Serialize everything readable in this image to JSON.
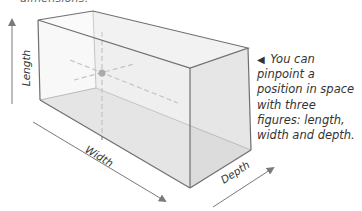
{
  "top_caption": "dimensions.",
  "caption": {
    "marker": "◀",
    "text": "You can pinpoint a position in space with three figures: length, width and depth."
  },
  "axes": {
    "length": "Length",
    "width": "Width",
    "depth": "Depth"
  },
  "colors": {
    "edge": "#6f6f6f",
    "front_face": "#f0f0f0",
    "side_face": "#e6e6e6",
    "floor": "#d4d4d4",
    "dash": "#8a8a8a",
    "point": "#555555",
    "arrow": "#7a7a7a"
  }
}
